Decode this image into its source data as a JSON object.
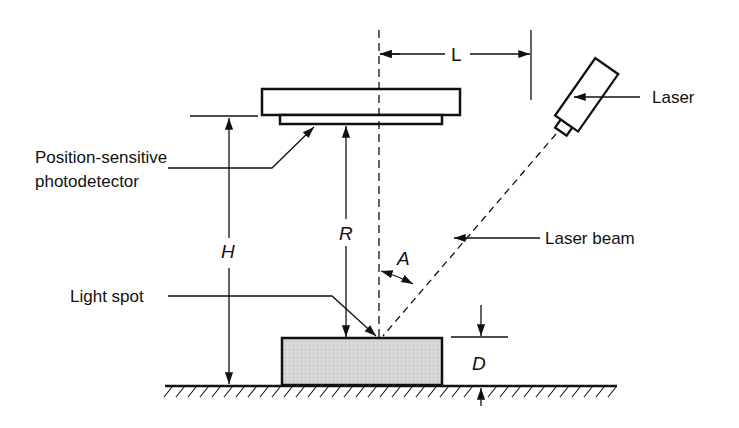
{
  "diagram": {
    "labels": {
      "laser": "Laser",
      "photodetector_line1": "Position-sensitive",
      "photodetector_line2": "photodetector",
      "laser_beam": "Laser beam",
      "light_spot": "Light spot"
    },
    "dimensions": {
      "L": "L",
      "H": "H",
      "R": "R",
      "A": "A",
      "D": "D"
    },
    "colors": {
      "line": "#111111",
      "sample_fill": "#d4d4d4",
      "background": "#ffffff"
    }
  }
}
